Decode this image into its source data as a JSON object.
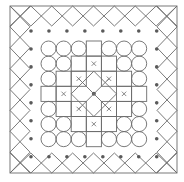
{
  "figure": {
    "title": "",
    "colors": {
      "background": "#ffffff",
      "stroke": "#6b6b6b",
      "dot": "#5a5a5a"
    },
    "frame": {
      "x": 10,
      "y": 6,
      "size": 167,
      "band": 20,
      "lattice_cells_per_side": 8
    },
    "dot_ring": {
      "count_per_side": 8
    },
    "grid": {
      "origin_x": 41,
      "origin_y": 41,
      "cell": 15.1,
      "rows": 7,
      "cols": 7,
      "legend": {
        "C": "circle",
        "S": "square",
        "X": "square-with-x-mark",
        "D": "diagonal-lines",
        "O": "center-dot",
        "_": "empty"
      },
      "cells": [
        [
          "C",
          "C",
          "C",
          "S",
          "C",
          "C",
          "C"
        ],
        [
          "C",
          "C",
          "S",
          "X",
          "S",
          "C",
          "C"
        ],
        [
          "C",
          "S",
          "X",
          "D",
          "X",
          "S",
          "C"
        ],
        [
          "S",
          "X",
          "D",
          "O",
          "D",
          "X",
          "S"
        ],
        [
          "C",
          "S",
          "X",
          "D",
          "X",
          "S",
          "C"
        ],
        [
          "C",
          "C",
          "S",
          "X",
          "S",
          "C",
          "C"
        ],
        [
          "C",
          "C",
          "C",
          "S",
          "C",
          "C",
          "C"
        ]
      ]
    }
  }
}
